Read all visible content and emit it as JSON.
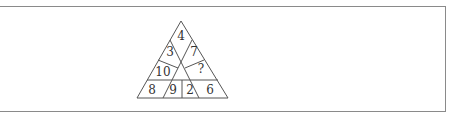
{
  "puzzle": {
    "type": "number-triangle",
    "cells": {
      "top": "4",
      "upper_left": "3",
      "upper_right": "7",
      "middle_left": "10",
      "middle_right": "?",
      "bottom_1": "8",
      "bottom_2": "9",
      "bottom_3": "2",
      "bottom_4": "6"
    }
  }
}
